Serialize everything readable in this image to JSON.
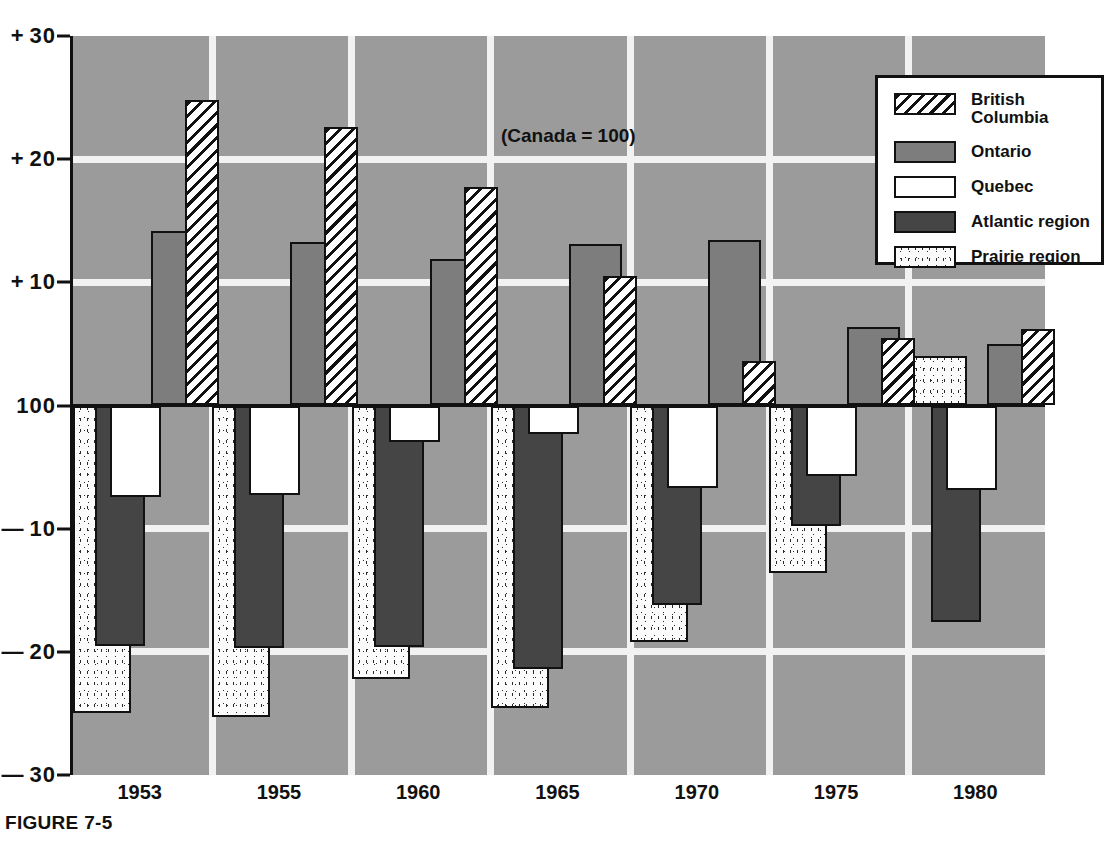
{
  "figure": {
    "caption": "FIGURE 7-5",
    "annotation": "(Canada = 100)"
  },
  "legend": {
    "items": [
      {
        "key": "bc",
        "label": "British\nColumbia",
        "swatch": "diagonal-hatch"
      },
      {
        "key": "on",
        "label": "Ontario",
        "swatch": "medium-gray"
      },
      {
        "key": "qc",
        "label": "Quebec",
        "swatch": "white"
      },
      {
        "key": "at",
        "label": "Atlantic region",
        "swatch": "dark-gray"
      },
      {
        "key": "pr",
        "label": "Prairie region",
        "swatch": "stipple"
      }
    ]
  },
  "axis": {
    "y_ticks": [
      {
        "sign": "+",
        "value": "30"
      },
      {
        "sign": "+",
        "value": "20"
      },
      {
        "sign": "+",
        "value": "10"
      },
      {
        "sign": "",
        "value": "100"
      },
      {
        "sign": "—",
        "value": "10"
      },
      {
        "sign": "—",
        "value": "20"
      },
      {
        "sign": "—",
        "value": "30"
      }
    ],
    "x_ticks": [
      "1953",
      "1955",
      "1960",
      "1965",
      "1970",
      "1975",
      "1980"
    ]
  },
  "chart_data": {
    "type": "bar",
    "title": "",
    "subtitle": "(Canada = 100)",
    "xlabel": "",
    "ylabel": "",
    "ylim": [
      -30,
      30
    ],
    "yticks": [
      -30,
      -20,
      -10,
      0,
      10,
      20,
      30
    ],
    "yticklabels": [
      "— 30",
      "— 20",
      "— 10",
      "100",
      "+ 10",
      "+ 20",
      "+ 30"
    ],
    "baseline": 100,
    "grid": true,
    "legend_position": "top-right",
    "categories": [
      "1953",
      "1955",
      "1960",
      "1965",
      "1970",
      "1975",
      "1980"
    ],
    "series": [
      {
        "name": "Prairie region",
        "key": "pr",
        "values": [
          -25.0,
          -25.3,
          -22.2,
          -24.6,
          -19.2,
          -13.6,
          4.0
        ]
      },
      {
        "name": "Atlantic region",
        "key": "at",
        "values": [
          -19.5,
          -19.7,
          -19.6,
          -21.4,
          -16.2,
          -9.8,
          -17.6
        ]
      },
      {
        "name": "Quebec",
        "key": "qc",
        "values": [
          -7.4,
          -7.3,
          -3.0,
          -2.3,
          -6.7,
          -5.7,
          -6.9
        ]
      },
      {
        "name": "Ontario",
        "key": "on",
        "values": [
          14.2,
          13.3,
          11.9,
          13.1,
          13.4,
          6.4,
          5.0
        ]
      },
      {
        "name": "British Columbia",
        "key": "bc",
        "values": [
          24.8,
          22.6,
          17.7,
          10.5,
          3.6,
          5.5,
          6.2
        ]
      }
    ]
  },
  "layout": {
    "plot": {
      "left": 70,
      "top": 36,
      "width": 975,
      "height": 739
    },
    "value_to_y": {
      "max": 30,
      "min": -30
    },
    "group_width": 139.3,
    "bars": [
      {
        "key": "pr",
        "offset": 0,
        "width": 58
      },
      {
        "key": "at",
        "offset": 22,
        "width": 50
      },
      {
        "key": "qc",
        "offset": 37,
        "width": 51
      },
      {
        "key": "on",
        "offset": 78,
        "width": 53
      },
      {
        "key": "bc",
        "offset": 112,
        "width": 34
      }
    ],
    "bars_1953_1965": [
      {
        "key": "pr",
        "offset": 0,
        "width": 58
      },
      {
        "key": "at",
        "offset": 22,
        "width": 50
      },
      {
        "key": "qc",
        "offset": 37,
        "width": 51
      },
      {
        "key": "on",
        "offset": 78,
        "width": 53
      },
      {
        "key": "bc",
        "offset": 112,
        "width": 34
      }
    ]
  }
}
